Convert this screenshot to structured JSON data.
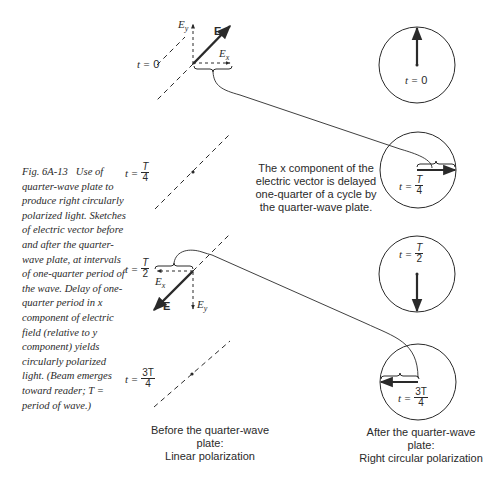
{
  "figure": {
    "number": "Fig. 6A-13",
    "caption": "Use of quarter-wave plate to produce right circularly polarized light. Sketches of electric vector before and after the quarter-wave plate, at intervals of one-quarter period of the wave. Delay of one-quarter period in x component of electric field (relative to y component) yields circularly polarized light. (Beam emerges toward reader; T = period of wave.)"
  },
  "time_labels": {
    "t_prefix": "t =",
    "t0": "0",
    "t1": {
      "num": "T",
      "den": "4"
    },
    "t2": {
      "num": "T",
      "den": "2"
    },
    "t3": {
      "num": "3T",
      "den": "4"
    }
  },
  "vector_labels": {
    "E": "E",
    "Ey": "E",
    "Ey_sub": "y",
    "Ex": "E",
    "Ex_sub": "x"
  },
  "note": "The x component of the electric vector is delayed one-quarter of a cycle by the quarter-wave plate.",
  "left_column": {
    "label_line1": "Before the quarter-wave plate:",
    "label_line2": "Linear polarization"
  },
  "right_column": {
    "label_line1": "After the quarter-wave plate:",
    "label_line2": "Right circular polarization"
  },
  "colors": {
    "ink": "#2a2a2a",
    "background": "#ffffff"
  }
}
